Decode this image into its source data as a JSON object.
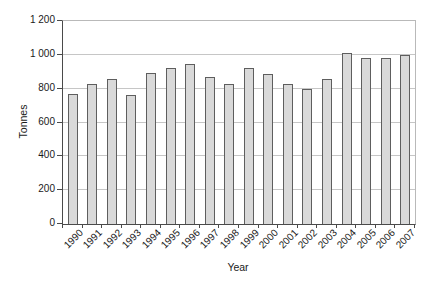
{
  "chart_data": {
    "type": "bar",
    "title": "",
    "xlabel": "Year",
    "ylabel": "Tonnes",
    "categories": [
      "1990",
      "1991",
      "1992",
      "1993",
      "1994",
      "1995",
      "1996",
      "1997",
      "1998",
      "1999",
      "2000",
      "2001",
      "2002",
      "2003",
      "2004",
      "2005",
      "2006",
      "2007"
    ],
    "values": [
      770,
      830,
      860,
      765,
      890,
      925,
      945,
      870,
      830,
      925,
      885,
      830,
      800,
      855,
      1010,
      980,
      980,
      1000
    ],
    "ylim": [
      0,
      1200
    ],
    "y_tick_step": 200,
    "y_tick_labels": [
      "0",
      "200",
      "400",
      "600",
      "800",
      "1 000",
      "1 200"
    ],
    "grid": true,
    "legend_position": "none",
    "bar_fill_color": "#d9d9d9",
    "bar_border_color": "#5e5e5e",
    "gridline_color": "#c6c6c6",
    "axis_color": "#4a4a4a",
    "frame_color": "#b9b9b9"
  }
}
